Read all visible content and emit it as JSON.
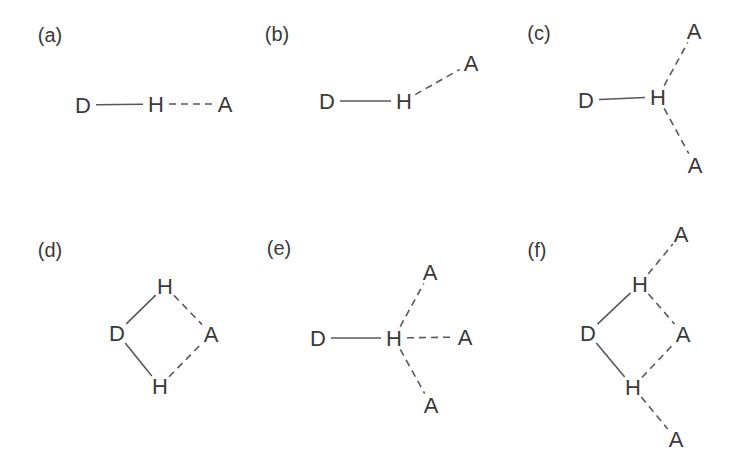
{
  "figure": {
    "name": "hydrogen-bond-geometries",
    "canvas": {
      "width": 736,
      "height": 464
    },
    "colors": {
      "background": "#ffffff",
      "ink": "#3a3a3a",
      "bond": "#585858"
    },
    "bond_gap": 13,
    "panels": [
      {
        "id": "a",
        "label": "(a)",
        "label_x": 50,
        "label_y": 35,
        "nodes": [
          {
            "id": "D",
            "text": "D",
            "x": 83,
            "y": 105
          },
          {
            "id": "H",
            "text": "H",
            "x": 156,
            "y": 104
          },
          {
            "id": "A",
            "text": "A",
            "x": 225,
            "y": 104
          }
        ],
        "bonds": [
          {
            "from": "D",
            "to": "H",
            "style": "solid"
          },
          {
            "from": "H",
            "to": "A",
            "style": "dashed"
          }
        ]
      },
      {
        "id": "b",
        "label": "(b)",
        "label_x": 277,
        "label_y": 34,
        "nodes": [
          {
            "id": "D",
            "text": "D",
            "x": 327,
            "y": 101
          },
          {
            "id": "H",
            "text": "H",
            "x": 404,
            "y": 101
          },
          {
            "id": "A",
            "text": "A",
            "x": 471,
            "y": 63
          }
        ],
        "bonds": [
          {
            "from": "D",
            "to": "H",
            "style": "solid"
          },
          {
            "from": "H",
            "to": "A",
            "style": "dashed"
          }
        ]
      },
      {
        "id": "c",
        "label": "(c)",
        "label_x": 539,
        "label_y": 33,
        "nodes": [
          {
            "id": "D",
            "text": "D",
            "x": 586,
            "y": 100
          },
          {
            "id": "H",
            "text": "H",
            "x": 658,
            "y": 97
          },
          {
            "id": "A1",
            "text": "A",
            "x": 694,
            "y": 31
          },
          {
            "id": "A2",
            "text": "A",
            "x": 695,
            "y": 165
          }
        ],
        "bonds": [
          {
            "from": "D",
            "to": "H",
            "style": "solid"
          },
          {
            "from": "H",
            "to": "A1",
            "style": "dashed"
          },
          {
            "from": "H",
            "to": "A2",
            "style": "dashed"
          }
        ]
      },
      {
        "id": "d",
        "label": "(d)",
        "label_x": 50,
        "label_y": 250,
        "nodes": [
          {
            "id": "H1",
            "text": "H",
            "x": 165,
            "y": 286
          },
          {
            "id": "D",
            "text": "D",
            "x": 117,
            "y": 333
          },
          {
            "id": "A",
            "text": "A",
            "x": 211,
            "y": 334
          },
          {
            "id": "H2",
            "text": "H",
            "x": 160,
            "y": 386
          }
        ],
        "bonds": [
          {
            "from": "D",
            "to": "H1",
            "style": "solid"
          },
          {
            "from": "D",
            "to": "H2",
            "style": "solid"
          },
          {
            "from": "H1",
            "to": "A",
            "style": "dashed"
          },
          {
            "from": "H2",
            "to": "A",
            "style": "dashed"
          }
        ]
      },
      {
        "id": "e",
        "label": "(e)",
        "label_x": 279,
        "label_y": 248,
        "nodes": [
          {
            "id": "D",
            "text": "D",
            "x": 318,
            "y": 338
          },
          {
            "id": "H",
            "text": "H",
            "x": 394,
            "y": 338
          },
          {
            "id": "A1",
            "text": "A",
            "x": 430,
            "y": 272
          },
          {
            "id": "A2",
            "text": "A",
            "x": 465,
            "y": 337
          },
          {
            "id": "A3",
            "text": "A",
            "x": 431,
            "y": 405
          }
        ],
        "bonds": [
          {
            "from": "D",
            "to": "H",
            "style": "solid"
          },
          {
            "from": "H",
            "to": "A1",
            "style": "dashed"
          },
          {
            "from": "H",
            "to": "A2",
            "style": "dashed"
          },
          {
            "from": "H",
            "to": "A3",
            "style": "dashed"
          }
        ]
      },
      {
        "id": "f",
        "label": "(f)",
        "label_x": 537,
        "label_y": 250,
        "nodes": [
          {
            "id": "A1",
            "text": "A",
            "x": 681,
            "y": 234
          },
          {
            "id": "H1",
            "text": "H",
            "x": 640,
            "y": 284
          },
          {
            "id": "D",
            "text": "D",
            "x": 588,
            "y": 333
          },
          {
            "id": "A2",
            "text": "A",
            "x": 683,
            "y": 334
          },
          {
            "id": "H2",
            "text": "H",
            "x": 633,
            "y": 387
          },
          {
            "id": "A3",
            "text": "A",
            "x": 676,
            "y": 439
          }
        ],
        "bonds": [
          {
            "from": "D",
            "to": "H1",
            "style": "solid"
          },
          {
            "from": "D",
            "to": "H2",
            "style": "solid"
          },
          {
            "from": "H1",
            "to": "A1",
            "style": "dashed"
          },
          {
            "from": "H1",
            "to": "A2",
            "style": "dashed"
          },
          {
            "from": "H2",
            "to": "A2",
            "style": "dashed"
          },
          {
            "from": "H2",
            "to": "A3",
            "style": "dashed"
          }
        ]
      }
    ]
  }
}
